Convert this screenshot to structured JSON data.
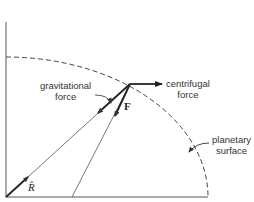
{
  "diagram": {
    "labels": {
      "gravitational": [
        "gravitational",
        "force"
      ],
      "centrifugal": [
        "centrifugal",
        "force"
      ],
      "surface": [
        "planetary",
        "surface"
      ],
      "force_vector": "F",
      "unit_vector": "R̂"
    },
    "colors": {
      "line": "#444444",
      "arrow": "#222222",
      "background": "#ffffff"
    }
  }
}
